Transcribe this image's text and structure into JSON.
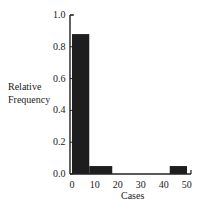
{
  "chart_data": {
    "type": "bar",
    "title": "",
    "xlabel": "Cases",
    "ylabel": "Relative Frequency",
    "ylabel_lines": [
      "Relative",
      "Frequency"
    ],
    "xlim": [
      0,
      58
    ],
    "ylim": [
      0,
      1.0
    ],
    "grid": false,
    "legend": null,
    "y_ticks": [
      "0.0",
      "0.2",
      "0.4",
      "0.6",
      "0.8",
      "1.0"
    ],
    "x_ticks": [
      "0",
      "10",
      "20",
      "30",
      "40",
      "50"
    ],
    "bins": [
      {
        "x_start": 0,
        "x_end": 7.5,
        "value": 0.88
      },
      {
        "x_start": 7.5,
        "x_end": 17.5,
        "value": 0.05
      },
      {
        "x_start": 42.5,
        "x_end": 50,
        "value": 0.05
      }
    ],
    "bar_color": "#1e1e1e"
  }
}
